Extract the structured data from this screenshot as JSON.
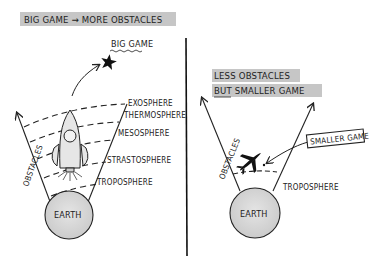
{
  "left_panel": {
    "banner": "BIG GAME → MORE OBSTACLES",
    "goal_label": "BIG GAME",
    "axis_label": "OBSTACLES",
    "planet_label": "EARTH",
    "layers": [
      {
        "label": "EXOSPHERE"
      },
      {
        "label": "THERMOSPHERE"
      },
      {
        "label": "MESOSPHERE"
      },
      {
        "label": "STRASTOSPHERE"
      },
      {
        "label": "TROPOSPHERE"
      }
    ],
    "vehicle": "rocket-icon",
    "target": "star-icon"
  },
  "right_panel": {
    "banner_line1": "LESS OBSTACLES",
    "banner_line2": "BUT SMALLER GAME",
    "axis_label": "OBSTACLES",
    "planet_label": "EARTH",
    "layer_label": "TROPOSPHERE",
    "callout": "SMALLER GAME",
    "vehicle": "airplane-icon"
  },
  "colors": {
    "ink": "#222222",
    "banner_highlight": "#c8c8c8",
    "planet_fill": "#d9d9d9",
    "rocket_fill": "#e6e6e6"
  }
}
